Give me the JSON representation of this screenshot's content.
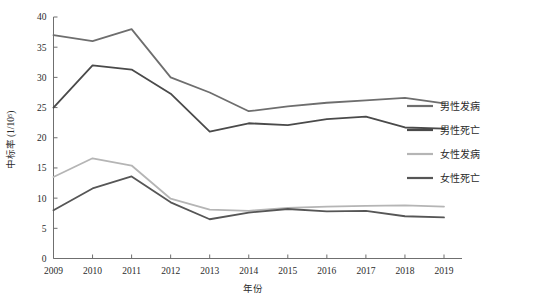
{
  "chart_data": {
    "type": "line",
    "title": "",
    "xlabel": "年份",
    "ylabel": "中标率 (1/10⁵)",
    "x": [
      "2009",
      "2010",
      "2011",
      "2012",
      "2013",
      "2014",
      "2015",
      "2016",
      "2017",
      "2018",
      "2019"
    ],
    "categories": [
      "2009",
      "2010",
      "2011",
      "2012",
      "2013",
      "2014",
      "2015",
      "2016",
      "2017",
      "2018",
      "2019"
    ],
    "xlim": [
      2009,
      2019
    ],
    "ylim": [
      0,
      40
    ],
    "yticks": [
      0,
      5,
      10,
      15,
      20,
      25,
      30,
      35,
      40
    ],
    "ytick_labels": [
      "0",
      "5",
      "10",
      "15",
      "20",
      "25",
      "30",
      "35",
      "40"
    ],
    "grid": false,
    "legend_position": "right",
    "series": [
      {
        "name": "男性发病",
        "color": "#6e6e6e",
        "values": [
          37.0,
          36.0,
          38.0,
          30.0,
          27.5,
          24.4,
          25.2,
          25.8,
          26.2,
          26.6,
          25.7
        ]
      },
      {
        "name": "男性死亡",
        "color": "#4a4a4a",
        "values": [
          25.0,
          32.0,
          31.3,
          27.3,
          21.0,
          22.4,
          22.1,
          23.1,
          23.5,
          21.7,
          21.5
        ]
      },
      {
        "name": "女性发病",
        "color": "#b5b5b5",
        "values": [
          13.5,
          16.6,
          15.4,
          9.9,
          8.1,
          7.9,
          8.4,
          8.6,
          8.7,
          8.8,
          8.6
        ]
      },
      {
        "name": "女性死亡",
        "color": "#565656",
        "values": [
          8.0,
          11.6,
          13.6,
          9.3,
          6.5,
          7.6,
          8.2,
          7.8,
          7.9,
          7.0,
          6.8
        ]
      }
    ]
  },
  "legend": {
    "items": [
      {
        "label": "男性发病",
        "color": "#6e6e6e"
      },
      {
        "label": "男性死亡",
        "color": "#4a4a4a"
      },
      {
        "label": "女性发病",
        "color": "#b5b5b5"
      },
      {
        "label": "女性死亡",
        "color": "#565656"
      }
    ]
  },
  "axes": {
    "x_title": "年份",
    "y_title": "中标率 (1/10⁵)"
  }
}
